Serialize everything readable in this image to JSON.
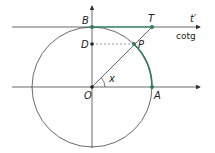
{
  "diagram": {
    "type": "unit-circle-cotangent",
    "labels": {
      "B": "B",
      "T": "T",
      "t_prime": "t′",
      "cotg": "cotg",
      "D": "D",
      "P": "P",
      "x": "x",
      "O": "O",
      "A": "A"
    },
    "colors": {
      "accent": "#2e7d5b",
      "line": "#333333",
      "dashed": "#888888"
    }
  }
}
